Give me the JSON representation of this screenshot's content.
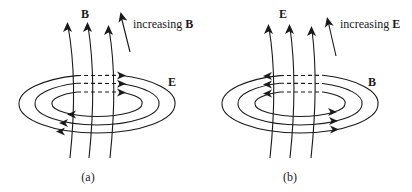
{
  "colors": {
    "ink": "#1a1a1a",
    "background": "#ffffff"
  },
  "panels": [
    {
      "id": "a",
      "caption": "(a)",
      "axial_field_label": "B",
      "loop_field_label": "E",
      "increasing_prefix": "increasing ",
      "increasing_symbol": "B",
      "offset_x": 0,
      "loop_direction_top": "right",
      "loop_direction_bottom": "left"
    },
    {
      "id": "b",
      "caption": "(b)",
      "axial_field_label": "E",
      "loop_field_label": "B",
      "increasing_prefix": "increasing ",
      "increasing_symbol": "E",
      "offset_x": 202,
      "loop_direction_top": "left",
      "loop_direction_bottom": "right"
    }
  ]
}
